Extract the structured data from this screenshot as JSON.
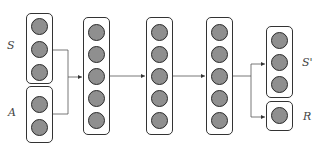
{
  "diagram": {
    "type": "neural-network-architecture",
    "labels": {
      "state": "S",
      "action": "A",
      "next_state": "S'",
      "reward": "R"
    },
    "layers": [
      {
        "name": "input-state",
        "nodes": 3
      },
      {
        "name": "input-action",
        "nodes": 2
      },
      {
        "name": "hidden-1",
        "nodes": 5
      },
      {
        "name": "hidden-2",
        "nodes": 5
      },
      {
        "name": "hidden-3",
        "nodes": 5
      },
      {
        "name": "output-next-state",
        "nodes": 3
      },
      {
        "name": "output-reward",
        "nodes": 1
      }
    ],
    "colors": {
      "node_fill": "#8f8f8f",
      "node_stroke": "#2a2a2a",
      "box_stroke": "#333333",
      "wire": "#555555"
    }
  }
}
